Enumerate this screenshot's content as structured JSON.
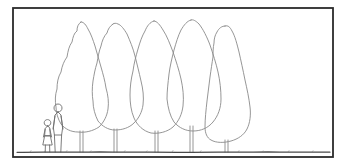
{
  "illustration": {
    "title": "Tree row elevation sketch with human figures for scale",
    "type": "line-drawing",
    "canvas": {
      "width": 345,
      "height": 166,
      "background": "#ffffff"
    },
    "colors": {
      "frame_stroke": "#2b2b2b",
      "sketch_stroke": "#8a8a8a",
      "ground_stroke": "#4a4a4a",
      "figure_stroke": "#6e6e6e",
      "background": "#ffffff"
    },
    "frame": {
      "label": "drawing-border",
      "x": 13,
      "y": 8,
      "width": 320,
      "height": 149,
      "stroke_width": 1.8
    },
    "ground_line": {
      "label": "ground-line",
      "y": 152,
      "x_start": 17,
      "x_end": 330,
      "stroke_width": 1.2
    },
    "trees": [
      {
        "name": "tree-1",
        "peak_x": 82,
        "peak_y": 22,
        "canopy_bottom_y": 131,
        "half_width": 26,
        "trunk_x": 82,
        "trunk_top_y": 131,
        "trunk_bottom_y": 152,
        "trunk_width": 3
      },
      {
        "name": "tree-2",
        "peak_x": 114,
        "peak_y": 24,
        "canopy_bottom_y": 129,
        "half_width": 26,
        "trunk_x": 116,
        "trunk_top_y": 129,
        "trunk_bottom_y": 152,
        "trunk_width": 3
      },
      {
        "name": "tree-3",
        "peak_x": 155,
        "peak_y": 21,
        "canopy_bottom_y": 131,
        "half_width": 28,
        "trunk_x": 157,
        "trunk_top_y": 131,
        "trunk_bottom_y": 152,
        "trunk_width": 3
      },
      {
        "name": "tree-4",
        "peak_x": 192,
        "peak_y": 20,
        "canopy_bottom_y": 126,
        "half_width": 28,
        "trunk_x": 192,
        "trunk_top_y": 126,
        "trunk_bottom_y": 152,
        "trunk_width": 3
      },
      {
        "name": "tree-5",
        "peak_x": 226,
        "peak_y": 26,
        "canopy_bottom_y": 140,
        "half_width": 28,
        "trunk_x": 226,
        "trunk_top_y": 140,
        "trunk_bottom_y": 152,
        "trunk_width": 3
      }
    ],
    "figures": [
      {
        "name": "figure-adult",
        "x": 58,
        "head_y": 108,
        "feet_y": 152,
        "height": 44
      },
      {
        "name": "figure-child",
        "x": 48,
        "head_y": 122,
        "feet_y": 152,
        "height": 30
      }
    ],
    "counts": {
      "trees": 5,
      "figures": 2
    }
  }
}
